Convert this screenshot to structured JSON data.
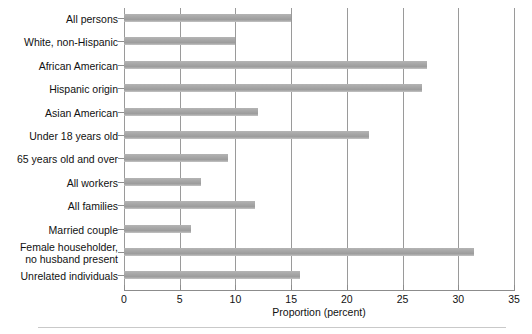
{
  "chart_data": {
    "type": "bar",
    "orientation": "horizontal",
    "title": "",
    "xlabel": "Proportion (percent)",
    "ylabel": "",
    "xlim": [
      0,
      35
    ],
    "xticks": [
      0,
      5,
      10,
      15,
      20,
      25,
      30,
      35
    ],
    "grid": "vertical",
    "legend": "none",
    "bar_color": "#a8a8a8",
    "categories": [
      "All persons",
      "White, non-Hispanic",
      "African American",
      "Hispanic origin",
      "Asian American",
      "Under 18 years old",
      "65 years old and over",
      "All workers",
      "All families",
      "Married couple",
      "Female householder,\nno husband present",
      "Unrelated individuals"
    ],
    "values": [
      15.0,
      10.0,
      27.2,
      26.7,
      12.0,
      22.0,
      9.3,
      6.9,
      11.8,
      6.0,
      31.4,
      15.8
    ]
  }
}
